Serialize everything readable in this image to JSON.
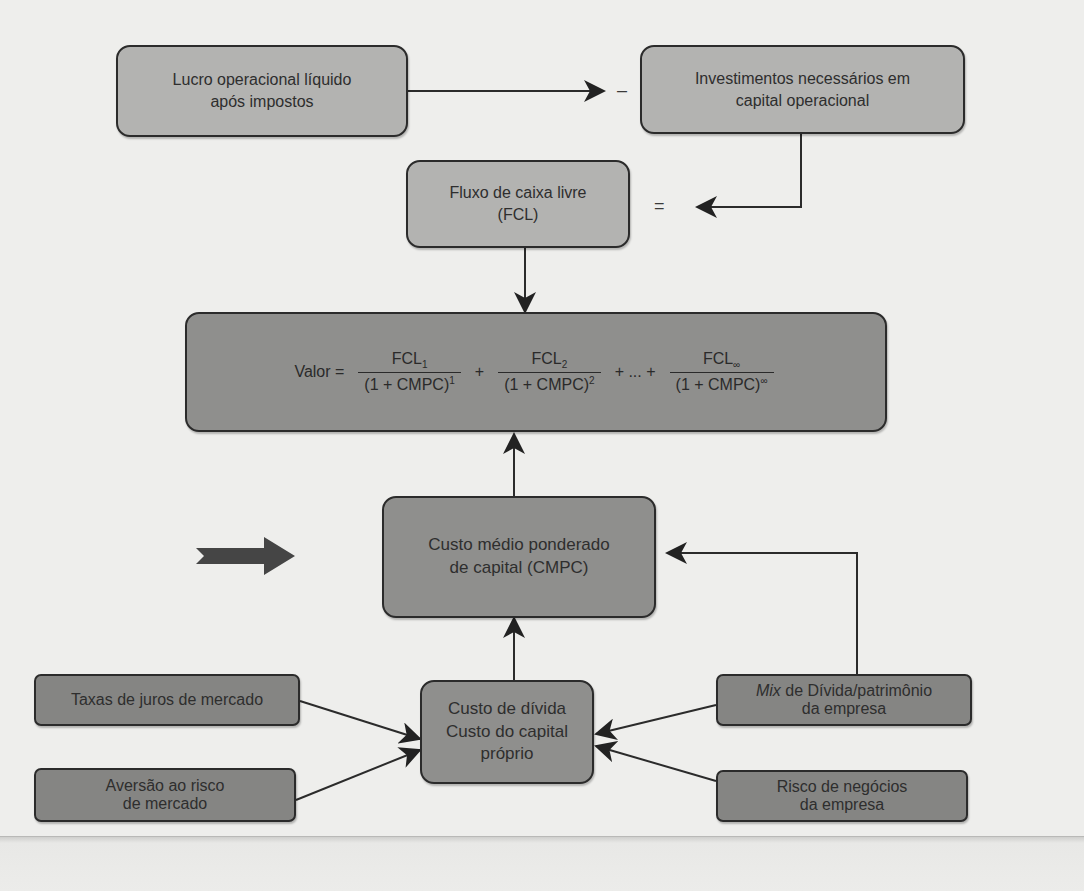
{
  "diagram": {
    "nodes": {
      "nopat": {
        "line1": "Lucro operacional líquido",
        "line2": "após impostos"
      },
      "investments": {
        "line1": "Investimentos necessários em",
        "line2": "capital operacional"
      },
      "fcf": {
        "line1": "Fluxo de caixa livre",
        "line2": "(FCL)"
      },
      "value": {
        "label": "Valor =",
        "terms": [
          {
            "num": "FCL",
            "num_sub": "1",
            "den": "(1 + CMPC)",
            "den_sup": "1"
          },
          {
            "num": "FCL",
            "num_sub": "2",
            "den": "(1 + CMPC)",
            "den_sup": "2"
          },
          {
            "num": "FCL",
            "num_sub": "∞",
            "den": "(1 + CMPC)",
            "den_sup": "∞"
          }
        ],
        "plus": "+",
        "ellipsis_plus": "+ ... +"
      },
      "wacc": {
        "line1": "Custo médio ponderado",
        "line2": "de capital (CMPC)"
      },
      "costs": {
        "line1": "Custo de dívida",
        "line2": "Custo do capital",
        "line3": "próprio"
      },
      "interest_rates": {
        "line1": "Taxas de juros de mercado"
      },
      "risk_aversion": {
        "line1": "Aversão ao risco",
        "line2": "de mercado"
      },
      "debt_mix": {
        "italic": "Mix",
        "rest": " de Dívida/patrimônio",
        "line2": "da empresa"
      },
      "business_risk": {
        "line1": "Risco de negócios",
        "line2": "da empresa"
      }
    },
    "symbols": {
      "minus": "–",
      "equals": "="
    },
    "edges": [
      {
        "from": "nopat",
        "to": "investments",
        "label": "–"
      },
      {
        "from": "investments",
        "to": "fcf",
        "label": "="
      },
      {
        "from": "fcf",
        "to": "value"
      },
      {
        "from": "wacc",
        "to": "value"
      },
      {
        "from": "costs",
        "to": "wacc"
      },
      {
        "from": "debt_mix",
        "to": "wacc"
      },
      {
        "from": "interest_rates",
        "to": "costs"
      },
      {
        "from": "risk_aversion",
        "to": "costs"
      },
      {
        "from": "debt_mix",
        "to": "costs"
      },
      {
        "from": "business_risk",
        "to": "costs"
      }
    ],
    "colors": {
      "light_box": "#b3b3b1",
      "mid_box": "#8f8f8d",
      "dark_box": "#858583",
      "background": "#eeeeec",
      "stroke": "#2b2b2b"
    }
  }
}
